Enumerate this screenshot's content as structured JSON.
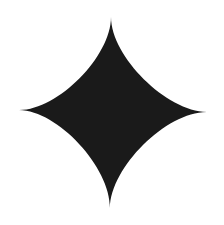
{
  "image": {
    "subject": "four-pointed-star",
    "background_color": "#ffffff",
    "fill_color": "#1a1a1a",
    "shape": {
      "tips": {
        "top": [
          111,
          17
        ],
        "right": [
          207,
          112
        ],
        "bottom": [
          110,
          208
        ],
        "left": [
          19,
          110
        ]
      },
      "center": [
        111,
        111
      ]
    }
  }
}
